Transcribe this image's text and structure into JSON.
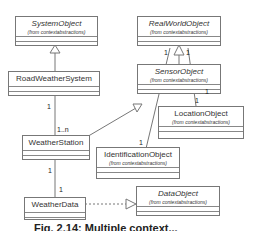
{
  "diagram": {
    "type": "UML class diagram",
    "classes": [
      {
        "id": "SystemObject",
        "name": "SystemObject",
        "package": "(from contextabstractions)",
        "abstract": true
      },
      {
        "id": "RealWorldObject",
        "name": "RealWorldObject",
        "package": "(from contextabstractions)",
        "abstract": true
      },
      {
        "id": "RoadWeatherSystem",
        "name": "RoadWeatherSystem",
        "package": "",
        "abstract": false
      },
      {
        "id": "SensorObject",
        "name": "SensorObject",
        "package": "(from contextabstractions)",
        "abstract": true
      },
      {
        "id": "LocationObject",
        "name": "LocationObject",
        "package": "(from contextabstractions)",
        "abstract": false
      },
      {
        "id": "WeatherStation",
        "name": "WeatherStation",
        "package": "",
        "abstract": false
      },
      {
        "id": "IdentificationObject",
        "name": "IdentificationObject",
        "package": "(from contextabstractions)",
        "abstract": false
      },
      {
        "id": "WeatherData",
        "name": "WeatherData",
        "package": "",
        "abstract": false
      },
      {
        "id": "DataObject",
        "name": "DataObject",
        "package": "(from contextabstractions)",
        "abstract": true
      }
    ],
    "relations": [
      {
        "type": "generalization",
        "from": "RoadWeatherSystem",
        "to": "SystemObject"
      },
      {
        "type": "generalization",
        "from": "SensorObject",
        "to": "RealWorldObject"
      },
      {
        "type": "generalization",
        "from": "WeatherStation",
        "to": "SensorObject"
      },
      {
        "type": "generalization",
        "from": "WeatherData",
        "to": "DataObject"
      },
      {
        "type": "association",
        "from": "RoadWeatherSystem",
        "to": "WeatherStation",
        "from_mult": "1",
        "to_mult": "1..n"
      },
      {
        "type": "association",
        "from": "WeatherStation",
        "to": "WeatherData",
        "from_mult": "1",
        "to_mult": "1"
      },
      {
        "type": "association",
        "from": "RealWorldObject",
        "to": "IdentificationObject",
        "from_mult": "1",
        "to_mult": "1"
      },
      {
        "type": "association",
        "from": "RealWorldObject",
        "to": "LocationObject",
        "from_mult": "1",
        "to_mult": "1"
      }
    ],
    "multiplicities": {
      "rws_ws_top": "1",
      "rws_ws_bottom": "1..n",
      "ws_wd_top": "1",
      "ws_wd_bottom": "1",
      "rwo_left": "1",
      "rwo_right": "1",
      "id_end": "1",
      "loc_top": "1",
      "loc_end": "1"
    }
  },
  "caption": "Fig. 2.14: Multiple context..."
}
